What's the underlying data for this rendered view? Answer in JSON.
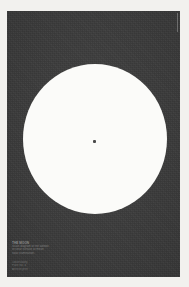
{
  "poster": {
    "background_color": "#f2f1ee",
    "page_color": "#3a3a3a",
    "disc_color": "#fbfbf9",
    "dot_color": "#4a4a4a"
  },
  "figure": {
    "disc_name": "large white circle",
    "center_dot_name": "center reference dot",
    "center_x": 94,
    "center_y": 140,
    "radius": 72
  },
  "caption": {
    "title": "THE MOON",
    "lines": [
      "Scale diagram of the albedo",
      "of lunar surface at mean",
      "solar illumination."
    ]
  },
  "credit": {
    "lines": [
      "Observatory",
      "Plate No. 4",
      "Archive print"
    ]
  },
  "marks": {
    "registration_tick": "registration tick"
  }
}
